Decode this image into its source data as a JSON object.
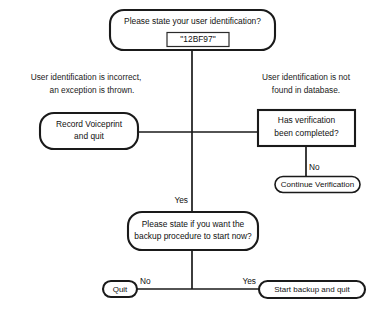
{
  "diagram": {
    "background_color": "#ffffff",
    "line_color": "#1a1a1a",
    "text_color": "#111111"
  },
  "nodes": {
    "prompt_userid": {
      "shape": "rounded-rectangle",
      "line1": "Please state your user identification?",
      "input_value": "\"12BF97\""
    },
    "record_voiceprint": {
      "shape": "rounded-rectangle",
      "line1": "Record Voiceprint",
      "line2": "and quit"
    },
    "has_verification": {
      "shape": "rectangle",
      "line1": "Has verification",
      "line2": "been completed?"
    },
    "continue_verification": {
      "shape": "stadium",
      "line1": "Continue Verification"
    },
    "prompt_backup": {
      "shape": "rounded-rectangle",
      "line1": "Please state if you want the",
      "line2": "backup procedure to start now?"
    },
    "quit": {
      "shape": "stadium",
      "line1": "Quit"
    },
    "start_backup": {
      "shape": "stadium",
      "line1": "Start backup and quit"
    }
  },
  "annotations": {
    "left": {
      "line1": "User identification is incorrect,",
      "line2": "an exception is thrown."
    },
    "right": {
      "line1": "User identification is not",
      "line2": "found in database."
    }
  },
  "edge_labels": {
    "verification_no": "No",
    "backup_branch_yes": "Yes",
    "quit_no": "No",
    "start_backup_yes": "Yes"
  }
}
